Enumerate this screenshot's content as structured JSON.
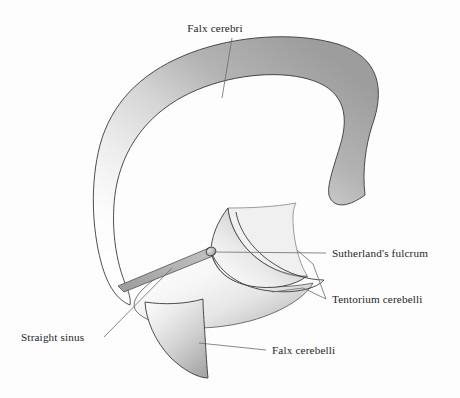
{
  "figure": {
    "kind": "anatomical-diagram",
    "background_color": "#fdfdfd",
    "outline_color": "#3a3a3a",
    "leader_line_color": "#6b6b6b",
    "text_color": "#1d1d1d",
    "canvas": {
      "width": 460,
      "height": 398
    }
  },
  "labels": {
    "falx_cerebri": "Falx cerebri",
    "sutherlands_fulcrum": "Sutherland's fulcrum",
    "tentorium_cerebelli": "Tentorium cerebelli",
    "straight_sinus": "Straight sinus",
    "falx_cerebelli": "Falx cerebelli"
  },
  "parts": [
    {
      "id": "falx-cerebri",
      "label": "Falx cerebri",
      "description": "Large sickle-shaped vertical membrane forming the C-shaped band",
      "fill_light": "#fcfcfc",
      "fill_dark": "#9d9d9d"
    },
    {
      "id": "tentorium-cerebelli",
      "label": "Tentorium cerebelli",
      "description": "Horizontal tent-like membrane, two crescent leaves",
      "fill_light": "#fbfbfb",
      "fill_dark": "#a9a9a9"
    },
    {
      "id": "straight-sinus",
      "label": "Straight sinus",
      "description": "Narrow band running from the fulcrum down to the lower left",
      "fill_light": "#bdbdbd",
      "fill_dark": "#949494"
    },
    {
      "id": "falx-cerebelli",
      "label": "Falx cerebelli",
      "description": "Small crescent fin descending below the tentorium",
      "fill_light": "#fafafa",
      "fill_dark": "#a6a6a6"
    },
    {
      "id": "sutherlands-fulcrum",
      "label": "Sutherland's fulcrum",
      "description": "Small ellipse marking the point of convergence of the membranes",
      "fill_light": "#d8d8d8",
      "fill_dark": "#9a9a9a"
    }
  ]
}
